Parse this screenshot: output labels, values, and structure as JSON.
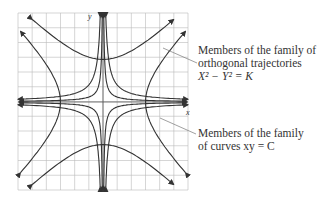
{
  "figure": {
    "axis_labels": {
      "x": "x",
      "y": "y"
    },
    "annotations": [
      {
        "id": "orthogonal",
        "lines": [
          "Members of the family of",
          "orthogonal trajectories",
          "X² − Y² = K"
        ]
      },
      {
        "id": "curves",
        "lines": [
          "Members of the family",
          "of curves xy = C"
        ]
      }
    ],
    "colors": {
      "curve": "#333333",
      "grid": "#bbbbbb",
      "leader": "#777777",
      "text": "#333333"
    }
  }
}
